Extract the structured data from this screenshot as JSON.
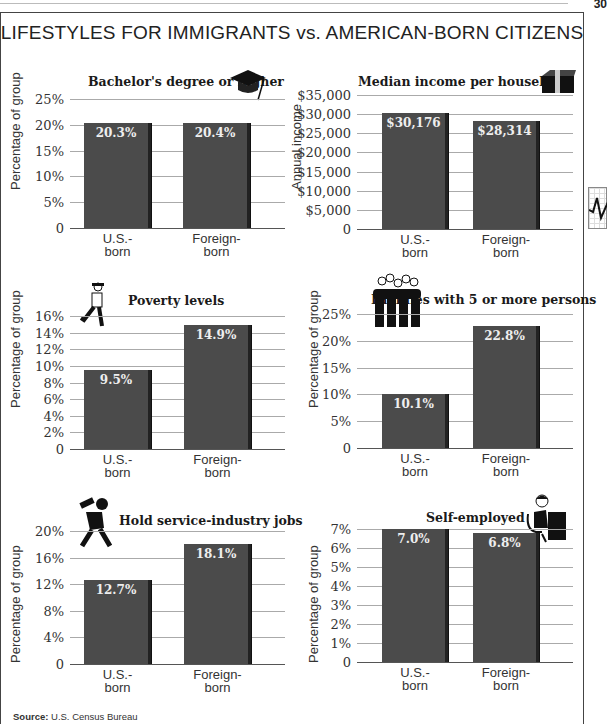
{
  "header": {
    "title": "LIFESTYLES FOR IMMIGRANTS vs. AMERICAN-BORN CITIZENS",
    "page_number": "30"
  },
  "source": {
    "label": "Source:",
    "text": "U.S. Census Bureau"
  },
  "categories": {
    "us": [
      "U.S.-",
      "born"
    ],
    "foreign": [
      "Foreign-",
      "born"
    ]
  },
  "chart_data": [
    {
      "type": "bar",
      "title": "Bachelor's degree or higher",
      "icon": "graduation-cap-icon",
      "xlabel": "",
      "ylabel": "Percentage of group",
      "categories": [
        "U.S.-born",
        "Foreign-born"
      ],
      "values": [
        20.3,
        20.4
      ],
      "value_labels": [
        "20.3%",
        "20.4%"
      ],
      "ylim": [
        0,
        25
      ],
      "yticks": [
        "0",
        "5%",
        "10%",
        "15%",
        "20%",
        "25%"
      ],
      "grid": true
    },
    {
      "type": "bar",
      "title": "Median income per household",
      "icon": "money-stack-icon",
      "xlabel": "",
      "ylabel": "Annual income",
      "categories": [
        "U.S.-born",
        "Foreign-born"
      ],
      "values": [
        30176,
        28314
      ],
      "value_labels": [
        "$30,176",
        "$28,314"
      ],
      "ylim": [
        0,
        35000
      ],
      "yticks": [
        "0",
        "$5,000",
        "$10,000",
        "$15,000",
        "$20,000",
        "$25,000",
        "$30,000",
        "$35,000"
      ],
      "grid": true
    },
    {
      "type": "bar",
      "title": "Poverty levels",
      "icon": "walking-man-icon",
      "xlabel": "",
      "ylabel": "Percentage of group",
      "categories": [
        "U.S.-born",
        "Foreign-born"
      ],
      "values": [
        9.5,
        14.9
      ],
      "value_labels": [
        "9.5%",
        "14.9%"
      ],
      "ylim": [
        0,
        16
      ],
      "yticks": [
        "0",
        "2%",
        "4%",
        "6%",
        "8%",
        "10%",
        "12%",
        "14%",
        "16%"
      ],
      "grid": true
    },
    {
      "type": "bar",
      "title": "Families with 5 or more persons",
      "icon": "family-group-icon",
      "xlabel": "",
      "ylabel": "Percentage of group",
      "categories": [
        "U.S.-born",
        "Foreign-born"
      ],
      "values": [
        10.1,
        22.8
      ],
      "value_labels": [
        "10.1%",
        "22.8%"
      ],
      "ylim": [
        0,
        25
      ],
      "yticks": [
        "0",
        "5%",
        "10%",
        "15%",
        "20%",
        "25%"
      ],
      "grid": true
    },
    {
      "type": "bar",
      "title": "Hold service-industry jobs",
      "icon": "waiter-icon",
      "xlabel": "",
      "ylabel": "Percentage of group",
      "categories": [
        "U.S.-born",
        "Foreign-born"
      ],
      "values": [
        12.7,
        18.1
      ],
      "value_labels": [
        "12.7%",
        "18.1%"
      ],
      "ylim": [
        0,
        20
      ],
      "yticks": [
        "0",
        "4%",
        "8%",
        "12%",
        "16%",
        "20%"
      ],
      "grid": true
    },
    {
      "type": "bar",
      "title": "Self-employed",
      "icon": "desk-worker-icon",
      "xlabel": "",
      "ylabel": "Percentage of group",
      "categories": [
        "U.S.-born",
        "Foreign-born"
      ],
      "values": [
        7.0,
        6.8
      ],
      "value_labels": [
        "7.0%",
        "6.8%"
      ],
      "ylim": [
        0,
        7
      ],
      "yticks": [
        "0",
        "1%",
        "2%",
        "3%",
        "4%",
        "5%",
        "6%",
        "7%"
      ],
      "grid": true
    }
  ],
  "colors": {
    "bar": "#4b4b4b",
    "bar_edge": "#222222",
    "grid": "#aaaaaa",
    "frame": "#444444"
  }
}
